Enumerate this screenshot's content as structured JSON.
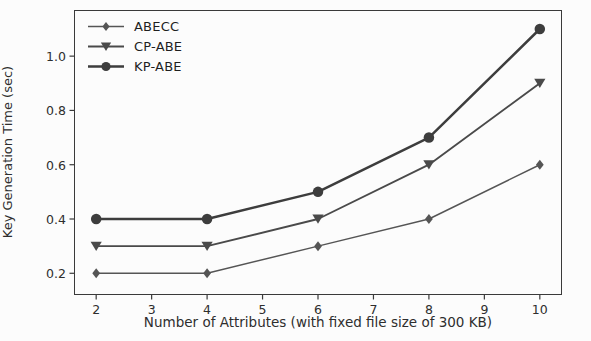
{
  "chart_data": {
    "type": "line",
    "title": "",
    "xlabel": "Number of Attributes (with fixed file size of 300 KB)",
    "ylabel": "Key Generation Time (sec)",
    "x": [
      2,
      4,
      6,
      8,
      10
    ],
    "xticks": [
      2,
      3,
      4,
      5,
      6,
      7,
      8,
      9,
      10
    ],
    "yticks": [
      0.2,
      0.4,
      0.6,
      0.8,
      1.0
    ],
    "xlim": [
      1.6,
      10.4
    ],
    "ylim": [
      0.12,
      1.17
    ],
    "grid": false,
    "legend_position": "upper left",
    "series": [
      {
        "name": "ABECC",
        "marker": "diamond",
        "color": "#555555",
        "values": [
          0.2,
          0.2,
          0.3,
          0.4,
          0.6
        ]
      },
      {
        "name": "CP-ABE",
        "marker": "triangle-down",
        "color": "#4a4a4a",
        "values": [
          0.3,
          0.3,
          0.4,
          0.6,
          0.9
        ]
      },
      {
        "name": "KP-ABE",
        "marker": "circle",
        "color": "#3d3d3d",
        "values": [
          0.4,
          0.4,
          0.5,
          0.7,
          1.1
        ]
      }
    ]
  },
  "axis": {
    "ytick_labels": [
      "0.2",
      "0.4",
      "0.6",
      "0.8",
      "1.0"
    ],
    "xtick_labels": [
      "2",
      "3",
      "4",
      "5",
      "6",
      "7",
      "8",
      "9",
      "10"
    ]
  },
  "legend": {
    "items": [
      {
        "label": "ABECC"
      },
      {
        "label": "CP-ABE"
      },
      {
        "label": "KP-ABE"
      }
    ]
  }
}
